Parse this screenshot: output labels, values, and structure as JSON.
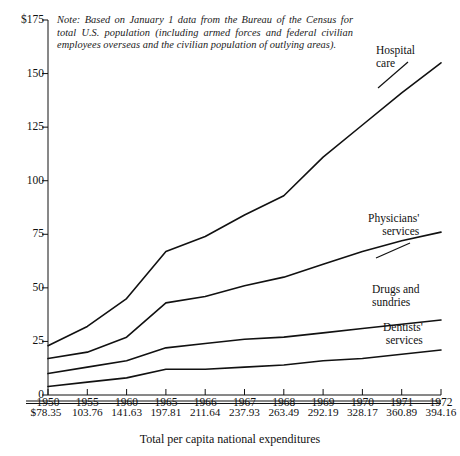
{
  "chart_data": {
    "type": "line",
    "title": "",
    "xlabel": "Total per capita national expenditures",
    "ylabel": "",
    "ylim": [
      0,
      175
    ],
    "grid": false,
    "legend_position": "right-inline-labels",
    "note": "Note: Based on January 1 data from the Bureau of the Census for total U.S. population (including armed forces and federal civilian employees overseas and the civilian population of outlying areas).",
    "categories": [
      "1950",
      "1955",
      "1960",
      "1965",
      "1966",
      "1967",
      "1968",
      "1969",
      "1970",
      "1971",
      "1972"
    ],
    "secondary_axis_label": "Total per capita national expenditures",
    "secondary_values": [
      "$78.35",
      "103.76",
      "141.63",
      "197.81",
      "211.64",
      "237.93",
      "263.49",
      "292.19",
      "328.17",
      "360.89",
      "394.16"
    ],
    "yticks": [
      "$175",
      "150",
      "125",
      "100",
      "75",
      "50",
      "25",
      "0"
    ],
    "ytick_values": [
      175,
      150,
      125,
      100,
      75,
      50,
      25,
      0
    ],
    "series": [
      {
        "name": "Hospital care",
        "label_line1": "Hospital",
        "label_line2": "care",
        "values": [
          23,
          32,
          45,
          67,
          74,
          84,
          93,
          111,
          126,
          141,
          155
        ]
      },
      {
        "name": "Physicians' services",
        "label_line1": "Physicians'",
        "label_line2": "services",
        "values": [
          17,
          20,
          27,
          43,
          46,
          51,
          55,
          61,
          67,
          72,
          76
        ]
      },
      {
        "name": "Drugs and sundries",
        "label_line1": "Drugs and",
        "label_line2": "sundries",
        "values": [
          10,
          13,
          16,
          22,
          24,
          26,
          27,
          29,
          31,
          33,
          35
        ]
      },
      {
        "name": "Dentists' services",
        "label_line1": "Dentists'",
        "label_line2": "services",
        "values": [
          4,
          6,
          8,
          12,
          12,
          13,
          14,
          16,
          17,
          19,
          21
        ]
      }
    ]
  }
}
